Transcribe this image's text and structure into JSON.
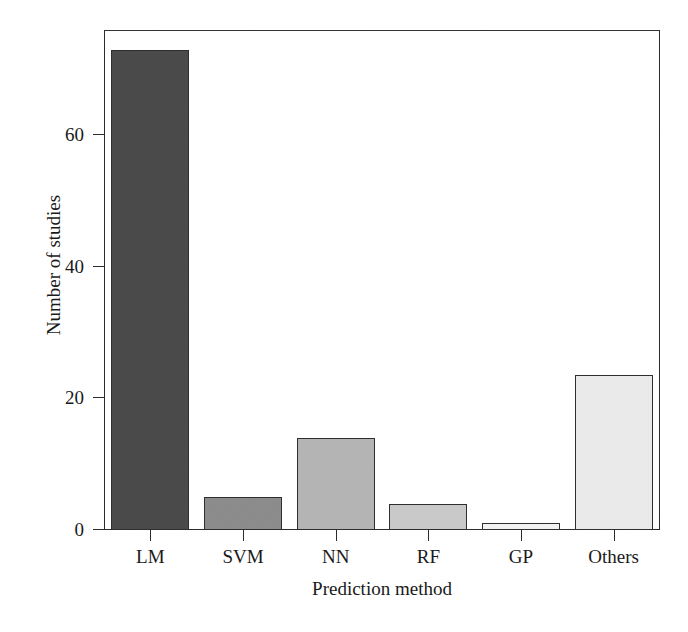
{
  "chart_data": {
    "type": "bar",
    "title": "",
    "subtitle": "",
    "xlabel": "Prediction method",
    "ylabel": "Number of studies",
    "categories": [
      "LM",
      "SVM",
      "NN",
      "RF",
      "GP",
      "Others"
    ],
    "values": [
      73,
      5,
      14,
      4,
      1,
      23.5
    ],
    "series": [
      {
        "name": "Number of studies",
        "values": [
          73,
          5,
          14,
          4,
          1,
          23.5
        ]
      }
    ],
    "bar_colors": [
      "#4a4a4a",
      "#8c8c8c",
      "#b4b4b4",
      "#c9c9c9",
      "#f2f2f2",
      "#eaeaea"
    ],
    "bar_edge_color": "#2e2e2e",
    "ylim": [
      0,
      76
    ],
    "yticks": [
      0,
      20,
      40,
      60
    ],
    "ytick_labels": [
      "0",
      "20",
      "40",
      "60"
    ],
    "xtick_labels": [
      "LM",
      "SVM",
      "NN",
      "RF",
      "GP",
      "Others"
    ],
    "grid": false,
    "legend": null,
    "legend_position": "none",
    "frame": true,
    "annotations": []
  },
  "axes": {
    "x_title": "Prediction method",
    "y_title": "Number of studies"
  }
}
